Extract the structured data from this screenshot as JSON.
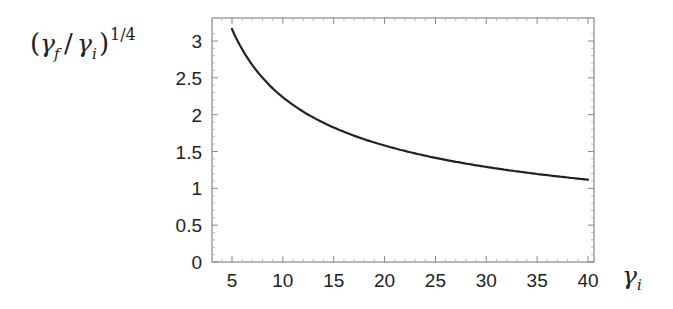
{
  "chart_data": {
    "type": "line",
    "title": "",
    "xlabel": "γ_i",
    "ylabel": "(γ_f/γ_i)^{1/4}",
    "xlim": [
      3,
      41
    ],
    "ylim": [
      0,
      3.3
    ],
    "grid": false,
    "legend": null,
    "x_ticks": [
      5,
      10,
      15,
      20,
      25,
      30,
      35,
      40
    ],
    "x_tick_labels": [
      "5",
      "10",
      "15",
      "20",
      "25",
      "30",
      "35",
      "40"
    ],
    "y_ticks": [
      0,
      0.5,
      1,
      1.5,
      2,
      2.5,
      3
    ],
    "y_tick_labels": [
      "0",
      "0.5",
      "1",
      "1.5",
      "2",
      "2.5",
      "3"
    ],
    "series": [
      {
        "name": "(γ_f/γ_i)^{1/4}",
        "color": "#222222",
        "x": [
          5,
          6,
          7,
          8,
          9,
          10,
          12,
          14,
          16,
          18,
          20,
          22,
          25,
          28,
          30,
          32,
          35,
          38,
          40
        ],
        "y": [
          3.16,
          2.89,
          2.67,
          2.5,
          2.36,
          2.24,
          2.04,
          1.89,
          1.77,
          1.67,
          1.58,
          1.51,
          1.41,
          1.34,
          1.29,
          1.25,
          1.2,
          1.15,
          1.12
        ]
      }
    ]
  },
  "labels": {
    "ylabel_parts": {
      "open": "(",
      "gamma_f": "γ",
      "sub_f": "f",
      "slash": "/",
      "gamma_i": "γ",
      "sub_i": "i",
      "close": ")",
      "exponent": "1/4"
    },
    "xlabel_parts": {
      "gamma": "γ",
      "sub": "i"
    }
  }
}
